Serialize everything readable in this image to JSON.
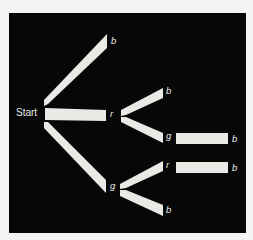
{
  "diagram": {
    "type": "probability-tree",
    "colors": {
      "background": "#f4f4f2",
      "panel": "#070707",
      "branch": "#e9e9e6",
      "text": "#ececea"
    },
    "root": {
      "label": "Start"
    },
    "nodes": {
      "level1_top": "b",
      "level1_mid": "r",
      "level1_bot": "g",
      "r_child_top": "b",
      "r_child_bot": "g",
      "g_child_top": "r",
      "g_child_bot": "b",
      "rg_child": "b",
      "gr_child": "b"
    },
    "tree": {
      "label": "Start",
      "children": [
        {
          "label": "b",
          "children": []
        },
        {
          "label": "r",
          "children": [
            {
              "label": "b",
              "children": []
            },
            {
              "label": "g",
              "children": [
                {
                  "label": "b",
                  "children": []
                }
              ]
            }
          ]
        },
        {
          "label": "g",
          "children": [
            {
              "label": "r",
              "children": [
                {
                  "label": "b",
                  "children": []
                }
              ]
            },
            {
              "label": "b",
              "children": []
            }
          ]
        }
      ]
    }
  }
}
